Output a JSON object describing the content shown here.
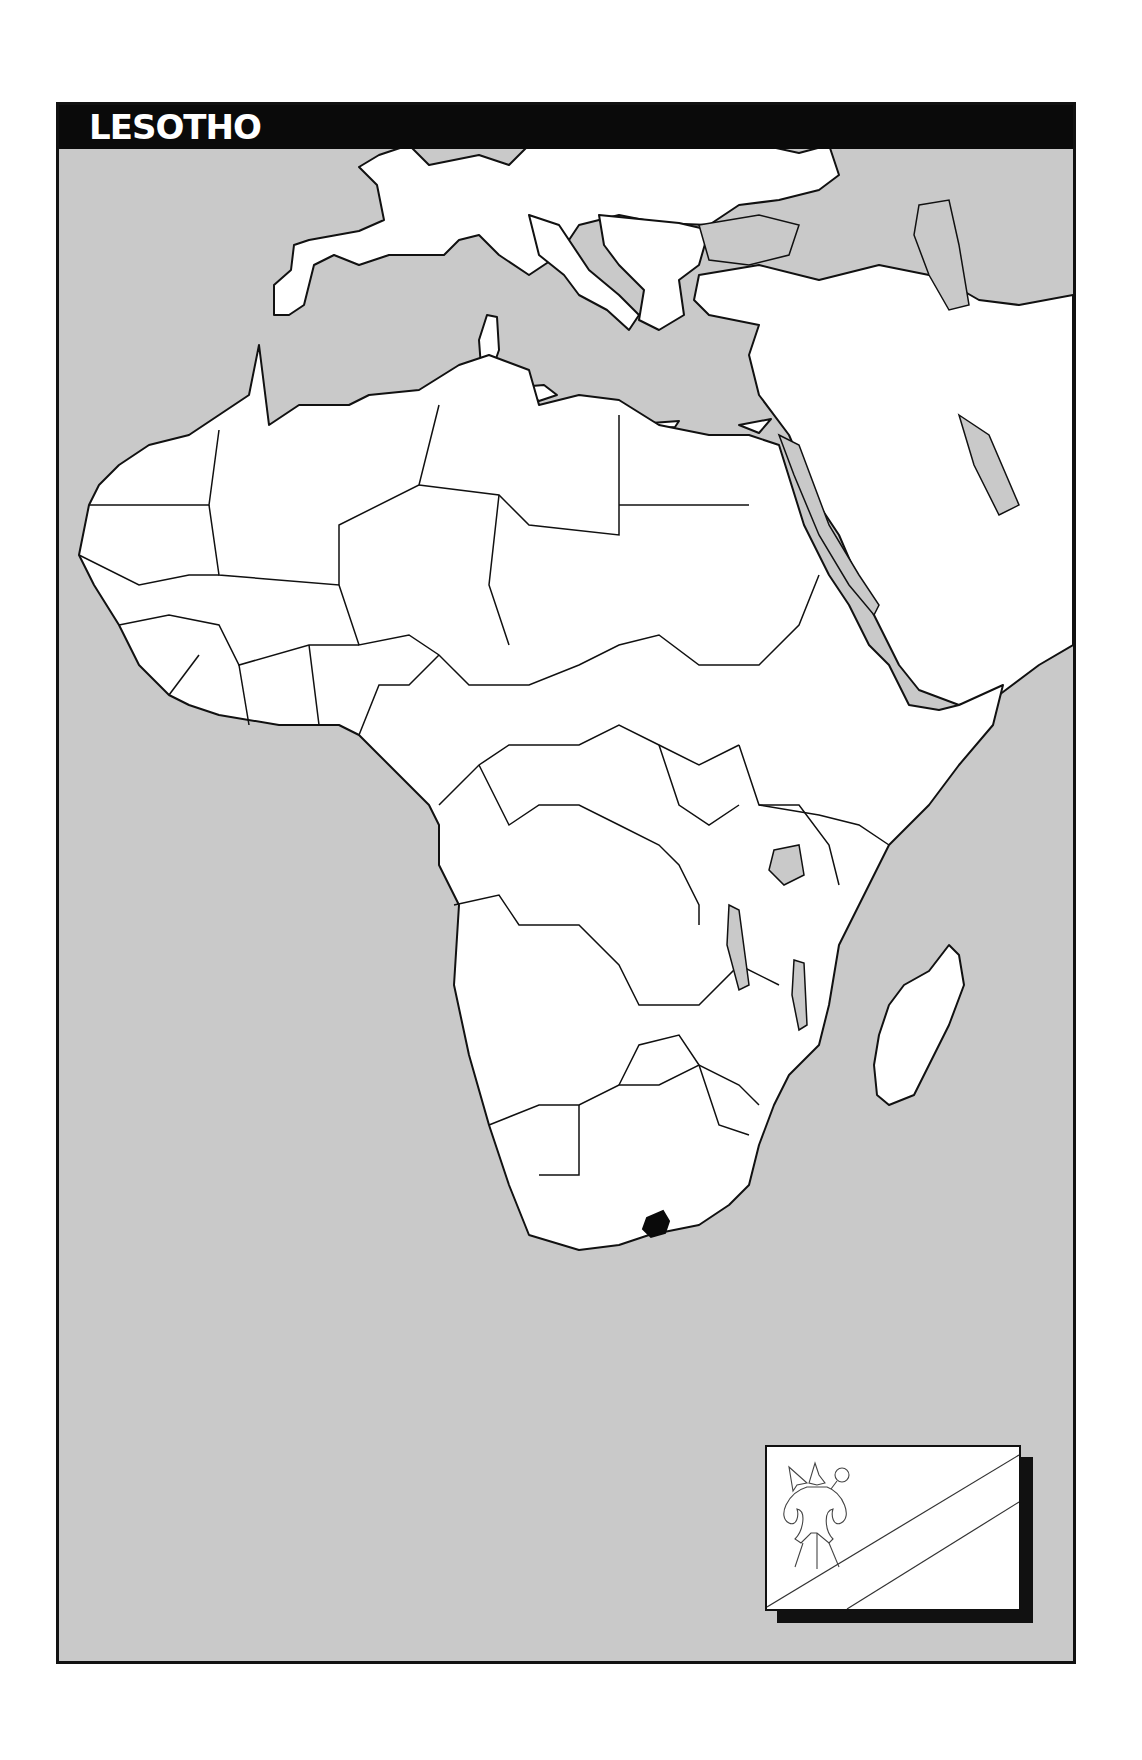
{
  "title": "LESOTHO",
  "colors": {
    "sea": "#c9c9c9",
    "land": "#ffffff",
    "border": "#111111",
    "highlight": "#0a0a0a",
    "title_bar": "#0a0a0a"
  },
  "map": {
    "region": "Africa",
    "highlighted_country": "Lesotho",
    "highlight_marker": "lesotho-shape-filled-black"
  },
  "flag": {
    "country": "Lesotho",
    "emblem": "basotho-hat-shield-spear-knobkerrie-outline",
    "stripes": "diagonal-band-outline"
  }
}
